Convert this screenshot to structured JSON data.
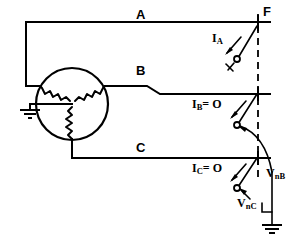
{
  "diagram": {
    "phase_labels": {
      "a": "A",
      "b": "B",
      "c": "C"
    },
    "fault_label": "F",
    "currents": [
      {
        "name": "current-a",
        "symbol": "I",
        "subscript": "A",
        "text": "I",
        "sub": "A",
        "suffix": ""
      },
      {
        "name": "current-b",
        "symbol": "I",
        "subscript": "B",
        "text": "I",
        "sub": "B",
        "suffix": "= O"
      },
      {
        "name": "current-c",
        "symbol": "I",
        "subscript": "C",
        "text": "I",
        "sub": "C",
        "suffix": "= O"
      }
    ],
    "voltages": [
      {
        "name": "voltage-nb",
        "text": "V",
        "sub": "nB"
      },
      {
        "name": "voltage-nc",
        "text": "V",
        "sub": "nC"
      }
    ],
    "ia_label_main": "I",
    "ia_label_sub": "A",
    "ib_label_main": "I",
    "ib_label_sub": "B",
    "ib_label_eq": "= O",
    "ic_label_main": "I",
    "ic_label_sub": "C",
    "ic_label_eq": "= O",
    "vnb_main": "V",
    "vnb_sub": "nB",
    "vnc_main": "V",
    "vnc_sub": "nC",
    "colors": {
      "line": "#000000",
      "background": "#ffffff"
    }
  }
}
